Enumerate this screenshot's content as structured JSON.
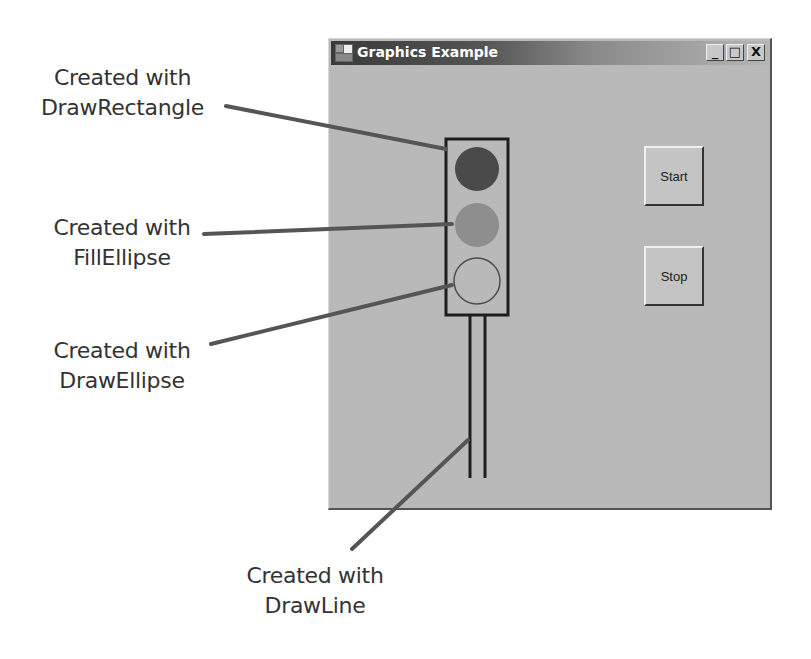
{
  "window": {
    "title": "Graphics Example",
    "controls": {
      "minimize": "_",
      "maximize": "□",
      "close": "X"
    },
    "buttons": {
      "start": "Start",
      "stop": "Stop"
    }
  },
  "traffic_light": {
    "housing": "rectangle outline",
    "lights": [
      {
        "position": "top",
        "style": "filled",
        "color": "#4a4a4a"
      },
      {
        "position": "middle",
        "style": "filled",
        "color": "#8e8e8e"
      },
      {
        "position": "bottom",
        "style": "outline",
        "color": "#555555"
      }
    ],
    "pole": "two vertical lines"
  },
  "callouts": [
    {
      "line1": "Created with",
      "line2": "DrawRectangle"
    },
    {
      "line1": "Created with",
      "line2": "FillEllipse"
    },
    {
      "line1": "Created with",
      "line2": "DrawEllipse"
    },
    {
      "line1": "Created with",
      "line2": "DrawLine"
    }
  ],
  "colors": {
    "window_bg": "#b9b9b9",
    "title_dark": "#3a3a3a",
    "leader_line": "#555555"
  }
}
